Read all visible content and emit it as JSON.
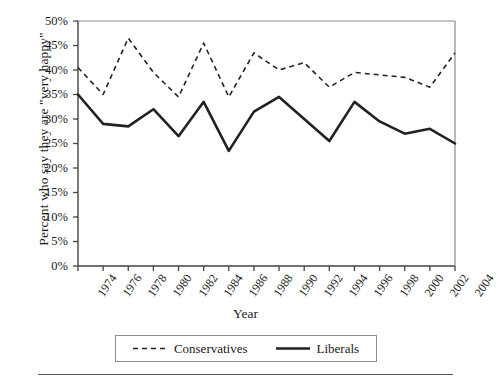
{
  "chart_data": {
    "type": "line",
    "title": "",
    "xlabel": "Year",
    "ylabel": "Percent who say they are \"very happy\"",
    "x": [
      1974,
      1976,
      1978,
      1980,
      1982,
      1984,
      1986,
      1988,
      1990,
      1992,
      1994,
      1996,
      1998,
      2000,
      2002,
      2004
    ],
    "categories": [
      "1974",
      "1976",
      "1978",
      "1980",
      "1982",
      "1984",
      "1986",
      "1988",
      "1990",
      "1992",
      "1994",
      "1996",
      "1998",
      "2000",
      "2002",
      "2004"
    ],
    "series": [
      {
        "name": "Conservatives",
        "style": "dashed",
        "color": "#222222",
        "values": [
          40.5,
          35.0,
          46.5,
          39.5,
          34.5,
          45.5,
          34.5,
          43.5,
          40.0,
          41.5,
          36.5,
          39.5,
          39.0,
          38.5,
          36.5,
          43.5
        ]
      },
      {
        "name": "Liberals",
        "style": "solid",
        "color": "#222222",
        "values": [
          35.0,
          29.0,
          28.5,
          32.0,
          26.5,
          33.5,
          23.5,
          31.5,
          34.5,
          30.0,
          25.5,
          33.5,
          29.5,
          27.0,
          28.0,
          25.0
        ]
      }
    ],
    "ylim": [
      0,
      50
    ],
    "yticks": [
      0,
      5,
      10,
      15,
      20,
      25,
      30,
      35,
      40,
      45,
      50
    ],
    "ytick_labels": [
      "0%",
      "5%",
      "10%",
      "15%",
      "20%",
      "25%",
      "30%",
      "35%",
      "40%",
      "45%",
      "50%"
    ],
    "xlim": [
      1974,
      2004
    ],
    "grid": false,
    "legend_position": "bottom-center",
    "legend_entries": [
      "Conservatives",
      "Liberals"
    ]
  },
  "axes": {
    "y_title": "Percent who say they are \"very happy\"",
    "x_title": "Year"
  },
  "legend": {
    "entries": [
      {
        "label": "Conservatives",
        "style": "dashed"
      },
      {
        "label": "Liberals",
        "style": "solid"
      }
    ]
  },
  "colors": {
    "line": "#222222",
    "axis": "#444444",
    "text": "#1a1a1a",
    "legend_border": "#8c8c8c",
    "rule": "#555555",
    "background": "#ffffff"
  }
}
